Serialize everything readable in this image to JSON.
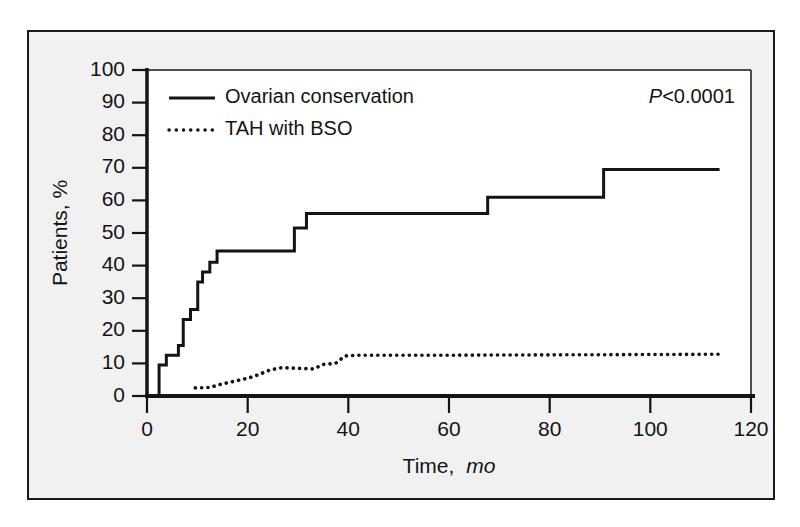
{
  "figure": {
    "background_color": "#f1f1f1",
    "plot_background_color": "#ffffff",
    "line_color": "#141414",
    "frame_color": "#1a1a1a"
  },
  "chart_data": {
    "type": "line",
    "title": "",
    "subtitle": "",
    "xlabel_main": "Time,",
    "xlabel_units": "mo",
    "ylabel": "Patients, %",
    "xlim": [
      0,
      125
    ],
    "ylim": [
      0,
      100
    ],
    "grid": false,
    "x_ticks": [
      0,
      20,
      40,
      60,
      80,
      100,
      120
    ],
    "x_tick_labels": [
      "0",
      "20",
      "40",
      "60",
      "80",
      "100",
      "120"
    ],
    "y_ticks": [
      0,
      10,
      20,
      30,
      40,
      50,
      60,
      70,
      80,
      90,
      100
    ],
    "y_tick_labels": [
      "0",
      "10",
      "20",
      "30",
      "40",
      "50",
      "60",
      "70",
      "80",
      "90",
      "100"
    ],
    "annotation": {
      "p_symbol": "P",
      "p_value_text": "<0.0001",
      "full_text": "P<0.0001"
    },
    "legend": {
      "position": "top-left",
      "entries": [
        {
          "label": "Ovarian conservation",
          "style": "solid",
          "key": "ovarian-conservation"
        },
        {
          "label": "TAH with BSO",
          "style": "dotted",
          "key": "tah-with-bso"
        }
      ]
    },
    "series": [
      {
        "name": "Ovarian conservation",
        "style": "solid",
        "step": true,
        "points": [
          [
            2.5,
            0
          ],
          [
            2.5,
            9.5
          ],
          [
            4.0,
            9.5
          ],
          [
            4.0,
            12.5
          ],
          [
            6.5,
            12.5
          ],
          [
            6.5,
            15.5
          ],
          [
            7.5,
            15.5
          ],
          [
            7.5,
            23.5
          ],
          [
            9.0,
            23.5
          ],
          [
            9.0,
            26.5
          ],
          [
            10.5,
            26.5
          ],
          [
            10.5,
            35.0
          ],
          [
            11.5,
            35.0
          ],
          [
            11.5,
            38.0
          ],
          [
            13.0,
            38.0
          ],
          [
            13.0,
            41.0
          ],
          [
            14.5,
            41.0
          ],
          [
            14.5,
            44.5
          ],
          [
            30.5,
            44.5
          ],
          [
            30.5,
            51.5
          ],
          [
            33.0,
            51.5
          ],
          [
            33.0,
            56.0
          ],
          [
            70.5,
            56.0
          ],
          [
            70.5,
            61.0
          ],
          [
            94.5,
            61.0
          ],
          [
            94.5,
            69.5
          ],
          [
            118.5,
            69.5
          ]
        ]
      },
      {
        "name": "TAH with BSO",
        "style": "dotted",
        "step": false,
        "points": [
          [
            10.0,
            2.5
          ],
          [
            13.0,
            2.6
          ],
          [
            15.0,
            3.5
          ],
          [
            18.0,
            4.5
          ],
          [
            21.0,
            5.5
          ],
          [
            23.0,
            6.5
          ],
          [
            25.5,
            8.0
          ],
          [
            28.0,
            8.7
          ],
          [
            31.0,
            8.5
          ],
          [
            34.5,
            8.3
          ],
          [
            36.5,
            9.7
          ],
          [
            39.0,
            10.0
          ],
          [
            41.0,
            12.3
          ],
          [
            44.0,
            12.5
          ],
          [
            60.0,
            12.5
          ],
          [
            80.0,
            12.6
          ],
          [
            100.0,
            12.7
          ],
          [
            118.5,
            12.8
          ]
        ]
      }
    ]
  }
}
